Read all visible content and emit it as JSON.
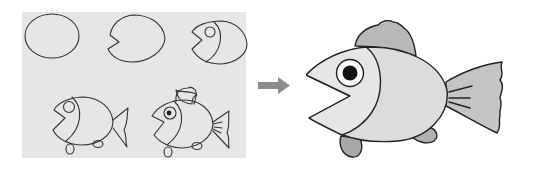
{
  "steps_panel": {
    "background": "#e6e6e6",
    "steps": [
      {
        "index": 1,
        "description": "Draw an oval"
      },
      {
        "index": 2,
        "description": "Cut a V-shaped mouth"
      },
      {
        "index": 3,
        "description": "Add head curve and eye"
      },
      {
        "index": 4,
        "description": "Add tail and bottom fins"
      },
      {
        "index": 5,
        "description": "Add dorsal fin, pupil and tail lines"
      }
    ]
  },
  "arrow": {
    "direction": "right",
    "color": "#8c8c8c"
  },
  "final_fish": {
    "description": "Finished shaded cartoon fish",
    "body_fill": "#dcdcdc",
    "head_fill": "#e4e4e4",
    "fin_fill": "#b4b4b4",
    "outline": "#222222"
  }
}
